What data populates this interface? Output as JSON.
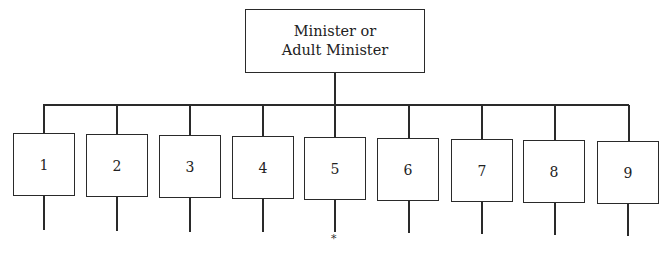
{
  "diagram": {
    "type": "org-chart",
    "root": {
      "line1": "Minister or",
      "line2": "Adult Minister"
    },
    "units": [
      {
        "label": "1",
        "marker": ""
      },
      {
        "label": "2",
        "marker": ""
      },
      {
        "label": "3",
        "marker": ""
      },
      {
        "label": "4",
        "marker": ""
      },
      {
        "label": "5",
        "marker": "*"
      },
      {
        "label": "6",
        "marker": ""
      },
      {
        "label": "7",
        "marker": ""
      },
      {
        "label": "8",
        "marker": ""
      },
      {
        "label": "9",
        "marker": ""
      }
    ],
    "colors": {
      "line": "#2a2a2a",
      "background": "#ffffff"
    }
  }
}
